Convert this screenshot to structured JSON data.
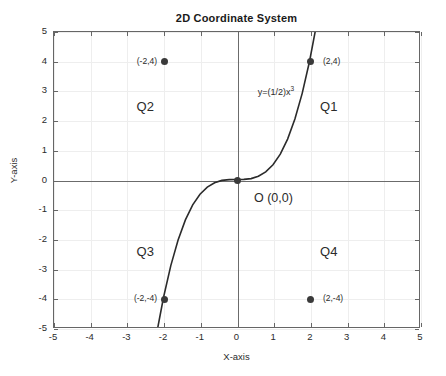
{
  "chart_data": {
    "type": "line",
    "title": "2D Coordinate System",
    "xlabel": "X-axis",
    "ylabel": "Y-axis",
    "xlim": [
      -5,
      5
    ],
    "ylim": [
      -5,
      5
    ],
    "grid": true,
    "legend": "none",
    "xticks": [
      "-5",
      "-4",
      "-3",
      "-2",
      "-1",
      "0",
      "1",
      "2",
      "3",
      "4",
      "5"
    ],
    "xtick_values": [
      -5,
      -4,
      -3,
      -2,
      -1,
      0,
      1,
      2,
      3,
      4,
      5
    ],
    "yticks": [
      "5",
      "4",
      "3",
      "2",
      "1",
      "0",
      "-1",
      "-2",
      "-3",
      "-4",
      "-5"
    ],
    "ytick_values": [
      5,
      4,
      3,
      2,
      1,
      0,
      -1,
      -2,
      -3,
      -4,
      -5
    ],
    "series": [
      {
        "name": "y=(1/2)x^3",
        "label": "y=(1/2)x",
        "label_sup": "3",
        "equation_coefficient": 0.5,
        "equation_exponent": 3,
        "color": "#2b2b2b",
        "x": [
          -2.16,
          -2.0,
          -1.8,
          -1.6,
          -1.4,
          -1.2,
          -1.0,
          -0.8,
          -0.6,
          -0.4,
          -0.2,
          0.0,
          0.2,
          0.4,
          0.6,
          0.8,
          1.0,
          1.2,
          1.4,
          1.6,
          1.8,
          2.0,
          2.16
        ],
        "y": [
          -5.04,
          -4.0,
          -2.92,
          -2.05,
          -1.37,
          -0.86,
          -0.5,
          -0.26,
          -0.11,
          -0.03,
          -0.004,
          0.0,
          0.004,
          0.03,
          0.11,
          0.26,
          0.5,
          0.86,
          1.37,
          2.05,
          2.92,
          4.0,
          5.04
        ]
      }
    ],
    "points": [
      {
        "name": "point-q2",
        "label": "(-2,4)",
        "x": -2,
        "y": 4,
        "label_side": "left"
      },
      {
        "name": "point-q1",
        "label": "(2,4)",
        "x": 2,
        "y": 4,
        "label_side": "right"
      },
      {
        "name": "point-origin",
        "label": "O (0,0)",
        "x": 0,
        "y": 0,
        "label_side": "right"
      },
      {
        "name": "point-q3",
        "label": "(-2,-4)",
        "x": -2,
        "y": -4,
        "label_side": "left"
      },
      {
        "name": "point-q4",
        "label": "(2,-4)",
        "x": 2,
        "y": -4,
        "label_side": "right"
      }
    ],
    "annotations": [
      {
        "name": "quadrant-q1",
        "text": "Q1",
        "x": 2.55,
        "y": 2.45
      },
      {
        "name": "quadrant-q2",
        "text": "Q2",
        "x": -2.45,
        "y": 2.45
      },
      {
        "name": "quadrant-q3",
        "text": "Q3",
        "x": -2.45,
        "y": -2.45
      },
      {
        "name": "quadrant-q4",
        "text": "Q4",
        "x": 2.55,
        "y": -2.45
      },
      {
        "name": "origin-text",
        "text": "O (0,0)",
        "x": 0.45,
        "y": -0.62
      }
    ],
    "colors": {
      "curve": "#2b2b2b",
      "marker": "#3a3a3a",
      "grid": "#eeeeee",
      "axis": "#6b6b6b",
      "box": "#666666",
      "background": "#ffffff",
      "text": "#2b2b2b"
    }
  }
}
